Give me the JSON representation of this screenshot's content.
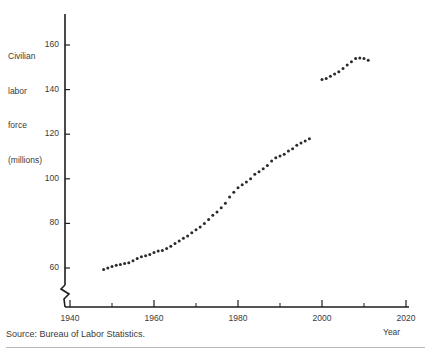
{
  "figure": {
    "source_note": "Source: Bureau of Labor Statistics.",
    "ylabel_line1": "Civilian",
    "ylabel_line2": "labor",
    "ylabel_line3": "force",
    "ylabel_line4": "(millions)",
    "xlabel": "Year"
  },
  "ticks": {
    "y": [
      "160",
      "140",
      "120",
      "100",
      "80",
      "60"
    ],
    "x": [
      "1940",
      "1960",
      "1980",
      "2000",
      "2020"
    ]
  },
  "chart_data": {
    "type": "scatter",
    "title": "",
    "subtitle": "",
    "xlabel": "Year",
    "ylabel": "Civilian labor force (millions)",
    "source": "Source: Bureau of Labor Statistics.",
    "xlim": [
      1940,
      2020
    ],
    "ylim": [
      52,
      170
    ],
    "y_axis_break": true,
    "grid": false,
    "legend": null,
    "x_major_ticks": [
      1940,
      1960,
      1980,
      2000,
      2020
    ],
    "x_minor_ticks": [
      1950,
      1970,
      1990,
      2010
    ],
    "y_major_ticks": [
      60,
      80,
      100,
      120,
      140,
      160
    ],
    "marker": "filled-circle",
    "marker_color": "#2b2b2b",
    "marker_size_px": 3.0,
    "series": [
      {
        "name": "Civilian labor force",
        "x": [
          1948,
          1949,
          1950,
          1951,
          1952,
          1953,
          1954,
          1955,
          1956,
          1957,
          1958,
          1959,
          1960,
          1961,
          1962,
          1963,
          1964,
          1965,
          1966,
          1967,
          1968,
          1969,
          1970,
          1971,
          1972,
          1973,
          1974,
          1975,
          1976,
          1977,
          1978,
          1979,
          1980,
          1981,
          1982,
          1983,
          1984,
          1985,
          1986,
          1987,
          1988,
          1989,
          1990,
          1991,
          1992,
          1993,
          1994,
          1995,
          1996,
          1997,
          2000,
          2001,
          2002,
          2003,
          2004,
          2005,
          2006,
          2007,
          2008,
          2009,
          2010,
          2011
        ],
        "y": [
          59.3,
          60.0,
          60.7,
          61.2,
          61.6,
          62.0,
          62.4,
          63.2,
          64.3,
          65.0,
          65.5,
          66.0,
          67.0,
          67.6,
          67.9,
          68.8,
          69.8,
          71.0,
          72.1,
          73.3,
          74.4,
          75.8,
          77.2,
          78.4,
          80.0,
          81.7,
          83.7,
          85.1,
          87.0,
          89.0,
          91.8,
          94.0,
          96.0,
          97.3,
          98.6,
          100.0,
          102.0,
          103.2,
          104.5,
          106.0,
          108.0,
          109.4,
          110.2,
          111.0,
          112.5,
          113.5,
          115.0,
          116.0,
          117.0,
          118.0,
          144.5,
          145.0,
          146.0,
          147.0,
          148.0,
          149.5,
          151.0,
          152.5,
          154.0,
          154.2,
          153.9,
          153.2
        ],
        "segments": [
          {
            "label": "1948-1997",
            "start_year": 1948,
            "end_year": 1997
          },
          {
            "label": "2000-2011",
            "start_year": 2000,
            "end_year": 2011
          }
        ]
      }
    ]
  },
  "geometry": {
    "plot_left_px": 65,
    "plot_bottom_px": 307,
    "px_per_year": 4.2,
    "px_per_million": 2.23,
    "y_ref_value": 60,
    "y_ref_px": 268,
    "x_ref_year": 1940,
    "x_ref_px": 70
  }
}
